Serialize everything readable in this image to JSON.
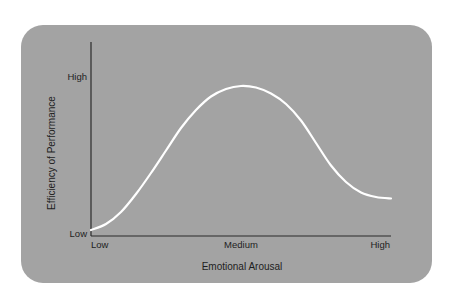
{
  "chart_data": {
    "type": "line",
    "title": "",
    "xlabel": "Emotional Arousal",
    "ylabel": "Efficiency of Performance",
    "x_tick_labels": [
      {
        "value": 0,
        "label": "Low"
      },
      {
        "value": 0.5,
        "label": "Medium"
      },
      {
        "value": 1,
        "label": "High"
      }
    ],
    "y_tick_labels": [
      {
        "value": 0,
        "label": "Low"
      },
      {
        "value": 1,
        "label": "High"
      }
    ],
    "xlim": [
      0,
      1
    ],
    "ylim": [
      0,
      1
    ],
    "grid": false,
    "legend": "none",
    "series": [
      {
        "name": "Yerkes-Dodson curve",
        "color": "#ffffff",
        "x": [
          0.0,
          0.05,
          0.1,
          0.15,
          0.2,
          0.25,
          0.3,
          0.35,
          0.4,
          0.45,
          0.5,
          0.55,
          0.6,
          0.65,
          0.7,
          0.75,
          0.8,
          0.85,
          0.9,
          0.95,
          1.0
        ],
        "y": [
          0.02,
          0.06,
          0.14,
          0.26,
          0.4,
          0.55,
          0.7,
          0.82,
          0.91,
          0.96,
          0.98,
          0.97,
          0.93,
          0.86,
          0.75,
          0.6,
          0.45,
          0.34,
          0.27,
          0.24,
          0.23
        ]
      }
    ]
  },
  "colors": {
    "background": "#ffffff",
    "card": "#a3a3a3",
    "axis": "#2a2a2a",
    "text": "#1e1e1e"
  }
}
